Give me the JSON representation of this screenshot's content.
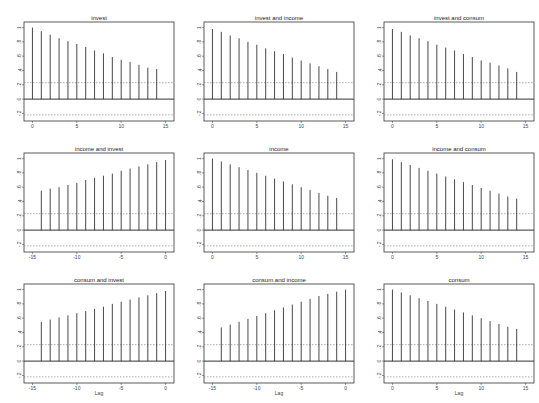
{
  "chart_data": {
    "type": "bar",
    "subtype": "spike correlogram matrix (3x3)",
    "ylim": [
      -0.25,
      1.05
    ],
    "yticks": [
      1,
      0.8,
      0.6,
      0.4,
      0.2,
      0,
      -0.2
    ],
    "ytick_labels": [
      "1",
      ".8",
      ".6",
      ".4",
      ".2",
      "0",
      "-.2"
    ],
    "grid": false,
    "legend": "none",
    "xlabel_bottom_row": "Lag",
    "confidence_band": {
      "upper": 0.23,
      "lower": -0.22
    },
    "panels": [
      {
        "row": 0,
        "col": 0,
        "title": "invest",
        "x": [
          0,
          1,
          2,
          3,
          4,
          5,
          6,
          7,
          8,
          9,
          10,
          11,
          12,
          13,
          14
        ],
        "xticks": [
          0,
          5,
          10,
          15
        ],
        "xtick_labels": [
          "0",
          "5",
          "10",
          "15"
        ],
        "values": [
          1.0,
          0.95,
          0.9,
          0.85,
          0.81,
          0.77,
          0.73,
          0.68,
          0.64,
          0.59,
          0.55,
          0.52,
          0.48,
          0.44,
          0.42
        ]
      },
      {
        "row": 0,
        "col": 1,
        "title": "invest and income",
        "x": [
          0,
          1,
          2,
          3,
          4,
          5,
          6,
          7,
          8,
          9,
          10,
          11,
          12,
          13,
          14
        ],
        "xticks": [
          0,
          5,
          10,
          15
        ],
        "xtick_labels": [
          "0",
          "5",
          "10",
          "15"
        ],
        "values": [
          0.98,
          0.94,
          0.89,
          0.85,
          0.8,
          0.76,
          0.71,
          0.67,
          0.63,
          0.58,
          0.54,
          0.5,
          0.46,
          0.42,
          0.38
        ]
      },
      {
        "row": 0,
        "col": 2,
        "title": "invest and consum",
        "x": [
          0,
          1,
          2,
          3,
          4,
          5,
          6,
          7,
          8,
          9,
          10,
          11,
          12,
          13,
          14
        ],
        "xticks": [
          0,
          5,
          10,
          15
        ],
        "xtick_labels": [
          "0",
          "5",
          "10",
          "15"
        ],
        "values": [
          0.98,
          0.94,
          0.89,
          0.85,
          0.81,
          0.76,
          0.72,
          0.68,
          0.63,
          0.59,
          0.54,
          0.51,
          0.47,
          0.43,
          0.38
        ]
      },
      {
        "row": 1,
        "col": 0,
        "title": "income and invest",
        "x": [
          -14,
          -13,
          -12,
          -11,
          -10,
          -9,
          -8,
          -7,
          -6,
          -5,
          -4,
          -3,
          -2,
          -1,
          0
        ],
        "xticks": [
          -15,
          -10,
          -5,
          0
        ],
        "xtick_labels": [
          "-15",
          "-10",
          "-5",
          "0"
        ],
        "values": [
          0.55,
          0.58,
          0.6,
          0.63,
          0.66,
          0.7,
          0.73,
          0.76,
          0.79,
          0.83,
          0.86,
          0.89,
          0.92,
          0.95,
          0.98
        ]
      },
      {
        "row": 1,
        "col": 1,
        "title": "income",
        "x": [
          0,
          1,
          2,
          3,
          4,
          5,
          6,
          7,
          8,
          9,
          10,
          11,
          12,
          13,
          14
        ],
        "xticks": [
          0,
          5,
          10,
          15
        ],
        "xtick_labels": [
          "0",
          "5",
          "10",
          "15"
        ],
        "values": [
          1.0,
          0.96,
          0.92,
          0.88,
          0.84,
          0.8,
          0.76,
          0.72,
          0.68,
          0.64,
          0.6,
          0.56,
          0.52,
          0.48,
          0.45
        ]
      },
      {
        "row": 1,
        "col": 2,
        "title": "income and consum",
        "x": [
          0,
          1,
          2,
          3,
          4,
          5,
          6,
          7,
          8,
          9,
          10,
          11,
          12,
          13,
          14
        ],
        "xticks": [
          0,
          5,
          10,
          15
        ],
        "xtick_labels": [
          "0",
          "5",
          "10",
          "15"
        ],
        "values": [
          0.99,
          0.95,
          0.91,
          0.87,
          0.83,
          0.79,
          0.75,
          0.71,
          0.67,
          0.63,
          0.59,
          0.55,
          0.51,
          0.47,
          0.44
        ]
      },
      {
        "row": 2,
        "col": 0,
        "title": "consum and invest",
        "x": [
          -14,
          -13,
          -12,
          -11,
          -10,
          -9,
          -8,
          -7,
          -6,
          -5,
          -4,
          -3,
          -2,
          -1,
          0
        ],
        "xticks": [
          -15,
          -10,
          -5,
          0
        ],
        "xtick_labels": [
          "-15",
          "-10",
          "-5",
          "0"
        ],
        "values": [
          0.55,
          0.58,
          0.61,
          0.64,
          0.67,
          0.7,
          0.73,
          0.76,
          0.8,
          0.83,
          0.86,
          0.89,
          0.92,
          0.95,
          0.98
        ]
      },
      {
        "row": 2,
        "col": 1,
        "title": "consum and income",
        "x": [
          -14,
          -13,
          -12,
          -11,
          -10,
          -9,
          -8,
          -7,
          -6,
          -5,
          -4,
          -3,
          -2,
          -1,
          0
        ],
        "xticks": [
          -15,
          -10,
          -5,
          0
        ],
        "xtick_labels": [
          "-15",
          "-10",
          "-5",
          "0"
        ],
        "values": [
          0.47,
          0.51,
          0.55,
          0.59,
          0.63,
          0.67,
          0.71,
          0.75,
          0.79,
          0.83,
          0.87,
          0.91,
          0.94,
          0.97,
          1.0
        ]
      },
      {
        "row": 2,
        "col": 2,
        "title": "consum",
        "x": [
          0,
          1,
          2,
          3,
          4,
          5,
          6,
          7,
          8,
          9,
          10,
          11,
          12,
          13,
          14
        ],
        "xticks": [
          0,
          5,
          10,
          15
        ],
        "xtick_labels": [
          "0",
          "5",
          "10",
          "15"
        ],
        "values": [
          1.0,
          0.96,
          0.92,
          0.88,
          0.84,
          0.8,
          0.76,
          0.72,
          0.68,
          0.64,
          0.6,
          0.56,
          0.52,
          0.48,
          0.45
        ]
      }
    ]
  },
  "colors": {
    "spike": "#333333",
    "frame": "#333333",
    "band": "#777777",
    "background": "#ffffff"
  }
}
